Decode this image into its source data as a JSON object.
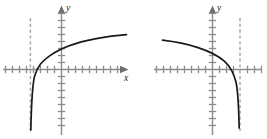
{
  "figure": {
    "title": "",
    "panel_count": 2
  },
  "chart_data": [
    {
      "type": "line",
      "title": "",
      "subtitle": "",
      "function": "increasing logarithmic curve",
      "xlabel": "x",
      "ylabel": "y",
      "grid": false,
      "legend": null,
      "axis_origin_px": {
        "x": 61.5,
        "y": 69.5
      },
      "tick_spacing_px": 7,
      "xlim": [
        -9,
        9
      ],
      "ylim": [
        -9,
        9
      ],
      "asymptote": {
        "type": "vertical",
        "x": -4.5,
        "style": "dashed"
      },
      "x_intercept": -3.4,
      "x_axis_arrow": true,
      "y_axis_arrow": true,
      "curve_path": "M 30.8,130 C 31.4,104 32.0,86 34.6,76.2 C 37.4,66.0 42.0,61.4 50.0,55.6 C 62.0,47.0 80.0,41.6 95.0,38.8 C 108.0,36.4 118.0,35.2 126.5,34.6",
      "points": [
        {
          "x": -4.4,
          "y": -8.6
        },
        {
          "x": -4.3,
          "y": -4.0
        },
        {
          "x": -4.1,
          "y": -1.0
        },
        {
          "x": -3.4,
          "y": 0.0
        },
        {
          "x": -1.6,
          "y": 2.0
        },
        {
          "x": 1.6,
          "y": 3.6
        },
        {
          "x": 4.8,
          "y": 4.4
        },
        {
          "x": 9.3,
          "y": 5.0
        }
      ]
    },
    {
      "type": "line",
      "title": "",
      "subtitle": "",
      "function": "decreasing logarithmic curve (reflected)",
      "xlabel": "",
      "ylabel": "y",
      "grid": false,
      "legend": null,
      "axis_origin_px": {
        "x": 78.5,
        "y": 69.5
      },
      "tick_spacing_px": 7,
      "xlim": [
        -9,
        9
      ],
      "ylim": [
        -9,
        9
      ],
      "asymptote": {
        "type": "vertical",
        "x": 3.9,
        "style": "dashed"
      },
      "x_intercept": 2.8,
      "x_axis_arrow": false,
      "y_axis_arrow": true,
      "curve_path": "M 28.5,40.2 C 40.0,41.6 54.0,44.4 64.0,47.6 C 76.0,51.4 84.0,55.6 90.6,61.4 C 96.0,66.4 99.6,72.6 102.0,82.0 C 103.6,89.0 104.6,103.0 105.2,128",
      "points": [
        {
          "x": -7.1,
          "y": 4.2
        },
        {
          "x": -5.5,
          "y": 4.0
        },
        {
          "x": -3.4,
          "y": 3.1
        },
        {
          "x": -0.6,
          "y": 1.7
        },
        {
          "x": 1.7,
          "y": 0.9
        },
        {
          "x": 2.8,
          "y": 0.0
        },
        {
          "x": 3.6,
          "y": -2.6
        },
        {
          "x": 3.8,
          "y": -8.4
        }
      ]
    }
  ],
  "labels": {
    "left_x_axis": "x",
    "left_y_axis": "y",
    "right_y_axis": "y"
  },
  "colors": {
    "background": "#ffffff",
    "axis": "#8c8c8c",
    "curve": "#1a1a1a",
    "asymptote": "#a8a8a8",
    "label_text": "#1a1a1a"
  }
}
